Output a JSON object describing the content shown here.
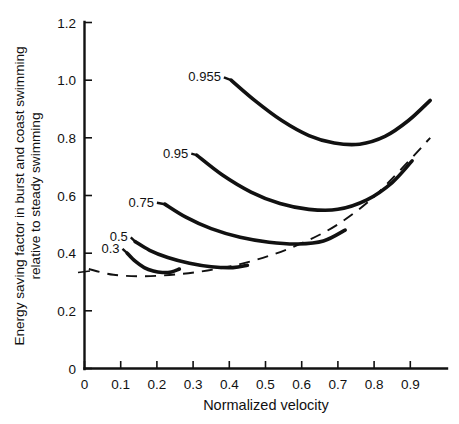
{
  "chart_data": {
    "type": "line",
    "title": "",
    "xlabel": "Normalized velocity",
    "ylabel": "Energy saving factor in burst and coast swimming relative to steady swimming",
    "ylabel_lines": [
      "Energy saving factor in burst and coast swimming",
      "relative to steady swimming"
    ],
    "xlim": [
      0,
      1.0
    ],
    "ylim": [
      0,
      1.2
    ],
    "xticks": [
      0,
      0.1,
      0.2,
      0.3,
      0.4,
      0.5,
      0.6,
      0.7,
      0.8,
      0.9
    ],
    "xticklabels": [
      "0",
      "0.1",
      "0.2",
      "0.3",
      "0.4",
      "0.5",
      "0.6",
      "0.7",
      "0.8",
      "0.9"
    ],
    "yticks": [
      0,
      0.2,
      0.4,
      0.6,
      0.8,
      1.0,
      1.2
    ],
    "yticklabels": [
      "0",
      "0.2",
      "0.4",
      "0.6",
      "0.8",
      "1.0",
      "1.2"
    ],
    "grid": false,
    "legend": "inline-curve-labels",
    "series": [
      {
        "name": "0.3",
        "label": "0.3",
        "style": "solid",
        "label_x": 0.105,
        "label_y": 0.415,
        "x": [
          0.118,
          0.14,
          0.165,
          0.19,
          0.215,
          0.24,
          0.262
        ],
        "y": [
          0.4,
          0.372,
          0.35,
          0.338,
          0.333,
          0.335,
          0.345
        ]
      },
      {
        "name": "0.5",
        "label": "0.5",
        "style": "solid",
        "label_x": 0.128,
        "label_y": 0.455,
        "x": [
          0.14,
          0.18,
          0.23,
          0.29,
          0.35,
          0.41,
          0.45
        ],
        "y": [
          0.44,
          0.41,
          0.385,
          0.365,
          0.353,
          0.35,
          0.358
        ]
      },
      {
        "name": "0.75",
        "label": "0.75",
        "style": "solid",
        "label_x": 0.2,
        "label_y": 0.575,
        "x": [
          0.222,
          0.28,
          0.35,
          0.43,
          0.51,
          0.59,
          0.66,
          0.72
        ],
        "y": [
          0.57,
          0.525,
          0.485,
          0.455,
          0.438,
          0.432,
          0.442,
          0.48
        ]
      },
      {
        "name": "0.95",
        "label": "0.95",
        "style": "solid",
        "label_x": 0.295,
        "label_y": 0.745,
        "x": [
          0.31,
          0.38,
          0.46,
          0.54,
          0.62,
          0.7,
          0.78,
          0.85,
          0.905
        ],
        "y": [
          0.74,
          0.672,
          0.612,
          0.572,
          0.552,
          0.552,
          0.585,
          0.645,
          0.72
        ]
      },
      {
        "name": "0.955",
        "label": "0.955",
        "style": "solid",
        "label_x": 0.385,
        "label_y": 1.01,
        "x": [
          0.405,
          0.47,
          0.545,
          0.62,
          0.69,
          0.76,
          0.83,
          0.895,
          0.955
        ],
        "y": [
          1.0,
          0.93,
          0.86,
          0.808,
          0.782,
          0.778,
          0.805,
          0.86,
          0.93
        ]
      },
      {
        "name": "envelope",
        "label": "",
        "style": "dashed",
        "x": [
          0.012,
          0.08,
          0.16,
          0.25,
          0.34,
          0.43,
          0.52,
          0.61,
          0.7,
          0.79,
          0.87,
          0.955
        ],
        "y": [
          0.345,
          0.325,
          0.32,
          0.326,
          0.34,
          0.362,
          0.395,
          0.44,
          0.5,
          0.585,
          0.685,
          0.8
        ]
      }
    ]
  }
}
